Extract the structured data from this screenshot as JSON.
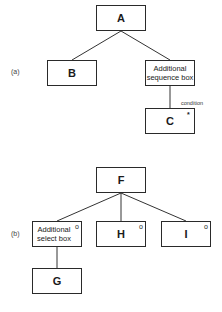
{
  "diagram_a": {
    "label": "(a)",
    "nodes": {
      "A": {
        "text": "A"
      },
      "B": {
        "text": "B"
      },
      "seq": {
        "text": "Additional sequence box"
      },
      "C": {
        "text": "C",
        "marker": "*"
      }
    },
    "condition_label": "condition"
  },
  "diagram_b": {
    "label": "(b)",
    "nodes": {
      "F": {
        "text": "F"
      },
      "sel": {
        "text": "Additional select box",
        "marker": "o"
      },
      "H": {
        "text": "H",
        "marker": "o"
      },
      "I": {
        "text": "I",
        "marker": "o"
      },
      "G": {
        "text": "G"
      }
    }
  }
}
